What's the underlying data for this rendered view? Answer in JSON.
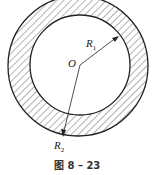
{
  "figure": {
    "caption": "图 8 – 23",
    "center_label": "O",
    "inner_radius_label": "R",
    "inner_radius_sub": "1",
    "outer_radius_label": "R",
    "outer_radius_sub": "2",
    "geometry": {
      "center": [
        80,
        65
      ],
      "inner_radius": 50,
      "outer_radius": 70,
      "hatched_region": "annulus between R1 and R2"
    },
    "colors": {
      "stroke": "#222222",
      "hatch": "#555555",
      "background": "#ffffff"
    }
  }
}
